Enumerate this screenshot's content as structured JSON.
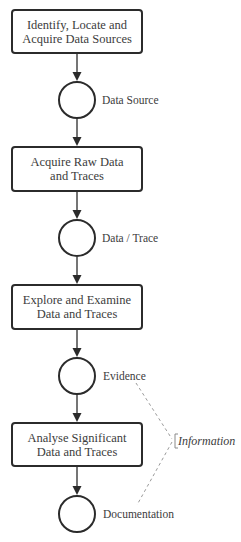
{
  "diagram": {
    "type": "process-flow",
    "steps": [
      {
        "label_line1": "Identify, Locate and",
        "label_line2": "Acquire Data Sources"
      },
      {
        "label_line1": "Acquire Raw Data",
        "label_line2": "and Traces"
      },
      {
        "label_line1": "Explore and Examine",
        "label_line2": "Data and Traces"
      },
      {
        "label_line1": "Analyse Significant",
        "label_line2": "Data and Traces"
      }
    ],
    "outputs": [
      {
        "label": "Data Source"
      },
      {
        "label": "Data / Trace"
      },
      {
        "label": "Evidence"
      },
      {
        "label": "Documentation"
      }
    ],
    "grouping": {
      "label": "Information",
      "spans": [
        "Evidence",
        "Documentation"
      ]
    },
    "colors": {
      "stroke": "#2b2b2b",
      "text": "#3c3c3c",
      "dashed": "#9a9a9a",
      "background": "#ffffff"
    }
  }
}
